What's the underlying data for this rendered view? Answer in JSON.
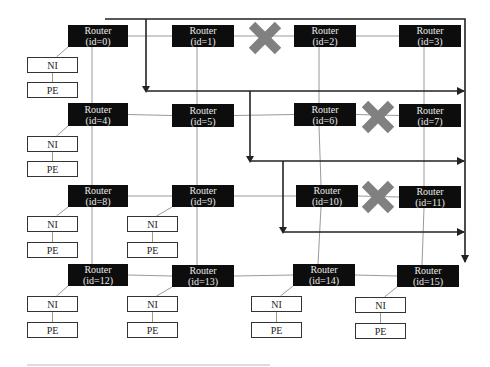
{
  "diagram": {
    "colors": {
      "router_bg": "#0d0d0d",
      "link": "#9a9a9a",
      "reroute": "#222222",
      "fault_x": "#808080"
    },
    "routers": [
      {
        "id": 0,
        "line1": "Router",
        "line2": "(id=0)",
        "x": 68,
        "y": 25,
        "w": 60,
        "h": 22
      },
      {
        "id": 1,
        "line1": "Router",
        "line2": "(id=1)",
        "x": 172,
        "y": 25,
        "w": 62,
        "h": 22
      },
      {
        "id": 2,
        "line1": "Router",
        "line2": "(id=2)",
        "x": 294,
        "y": 25,
        "w": 62,
        "h": 22
      },
      {
        "id": 3,
        "line1": "Router",
        "line2": "(id=3)",
        "x": 399,
        "y": 25,
        "w": 62,
        "h": 22
      },
      {
        "id": 4,
        "line1": "Router",
        "line2": "(id=4)",
        "x": 68,
        "y": 103,
        "w": 60,
        "h": 23
      },
      {
        "id": 5,
        "line1": "Router",
        "line2": "(id=5)",
        "x": 172,
        "y": 104,
        "w": 62,
        "h": 23
      },
      {
        "id": 6,
        "line1": "Router",
        "line2": "(id=6)",
        "x": 294,
        "y": 103,
        "w": 62,
        "h": 23
      },
      {
        "id": 7,
        "line1": "Router",
        "line2": "(id=7)",
        "x": 399,
        "y": 104,
        "w": 62,
        "h": 23
      },
      {
        "id": 8,
        "line1": "Router",
        "line2": "(id=8)",
        "x": 68,
        "y": 185,
        "w": 60,
        "h": 22
      },
      {
        "id": 9,
        "line1": "Router",
        "line2": "(id=9)",
        "x": 172,
        "y": 185,
        "w": 62,
        "h": 22
      },
      {
        "id": 10,
        "line1": "Router",
        "line2": "(id=10)",
        "x": 296,
        "y": 185,
        "w": 62,
        "h": 22
      },
      {
        "id": 11,
        "line1": "Router",
        "line2": "(id=11)",
        "x": 399,
        "y": 186,
        "w": 62,
        "h": 22
      },
      {
        "id": 12,
        "line1": "Router",
        "line2": "(id=12)",
        "x": 68,
        "y": 264,
        "w": 60,
        "h": 22
      },
      {
        "id": 13,
        "line1": "Router",
        "line2": "(id=13)",
        "x": 172,
        "y": 265,
        "w": 62,
        "h": 22
      },
      {
        "id": 14,
        "line1": "Router",
        "line2": "(id=14)",
        "x": 293,
        "y": 264,
        "w": 62,
        "h": 22
      },
      {
        "id": 15,
        "line1": "Router",
        "line2": "(id=15)",
        "x": 397,
        "y": 265,
        "w": 62,
        "h": 22
      }
    ],
    "ni_label": "NI",
    "pe_label": "PE",
    "endpoints": [
      {
        "router": 0,
        "x": 27,
        "ni_y": 57,
        "pe_y": 82
      },
      {
        "router": 4,
        "x": 27,
        "ni_y": 136,
        "pe_y": 161
      },
      {
        "router": 8,
        "x": 27,
        "ni_y": 216,
        "pe_y": 242
      },
      {
        "router": 9,
        "x": 127,
        "ni_y": 216,
        "pe_y": 242
      },
      {
        "router": 12,
        "x": 27,
        "ni_y": 296,
        "pe_y": 322
      },
      {
        "router": 13,
        "x": 127,
        "ni_y": 296,
        "pe_y": 322
      },
      {
        "router": 14,
        "x": 251,
        "ni_y": 296,
        "pe_y": 322
      },
      {
        "router": 15,
        "x": 355,
        "ni_y": 297,
        "pe_y": 323
      }
    ],
    "faults": [
      {
        "between": [
          1,
          2
        ],
        "cx": 265,
        "cy": 38
      },
      {
        "between": [
          6,
          7
        ],
        "cx": 378,
        "cy": 117
      },
      {
        "between": [
          10,
          11
        ],
        "cx": 378,
        "cy": 197
      }
    ],
    "footer_rule": {
      "x1": 27,
      "x2": 270,
      "y": 365
    }
  }
}
